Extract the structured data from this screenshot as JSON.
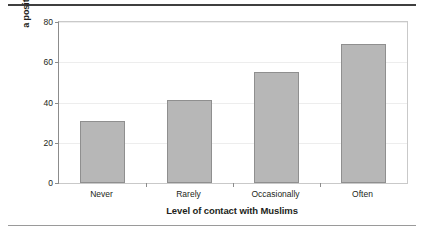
{
  "chart_data": {
    "type": "bar",
    "title": "",
    "categories": [
      "Never",
      "Rarely",
      "Occasionally",
      "Often"
    ],
    "values": [
      31,
      41,
      55,
      69
    ],
    "xlabel": "Level of contact with Muslims",
    "ylabel_line1": "% reporting",
    "ylabel_line2": "a positive impression of Islam",
    "ylim": [
      0,
      80
    ],
    "yticks": [
      0,
      20,
      40,
      60,
      80
    ],
    "ytick_labels": [
      "0",
      "20",
      "40",
      "60",
      "80"
    ],
    "grid": true,
    "legend": "none",
    "bar_color": "#b7b7b7",
    "bar_border_color": "#8f8f8f",
    "axis_color": "#8c8c8c",
    "grid_color": "#ededed",
    "text_color": "#231f20",
    "rule_top_color": "#3f3f3f",
    "rule_bottom_color": "#9a9a9a"
  }
}
